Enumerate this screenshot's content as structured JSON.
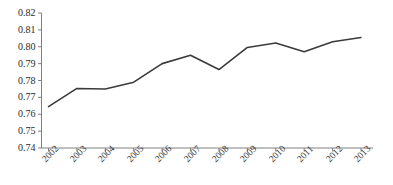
{
  "chart_data": {
    "type": "line",
    "title": "",
    "subtitle": "",
    "xlabel": "",
    "ylabel": "",
    "categories": [
      "2002",
      "2003",
      "2004",
      "2005",
      "2006",
      "2007",
      "2008",
      "2009",
      "2010",
      "2011",
      "2012",
      "2013"
    ],
    "values": [
      0.7645,
      0.7753,
      0.775,
      0.779,
      0.79,
      0.795,
      0.7865,
      0.7996,
      0.8022,
      0.797,
      0.803,
      0.8055
    ],
    "series": [
      {
        "name": "",
        "values": [
          0.7645,
          0.7753,
          0.775,
          0.779,
          0.79,
          0.795,
          0.7865,
          0.7996,
          0.8022,
          0.797,
          0.803,
          0.8055
        ]
      }
    ],
    "ylim": [
      0.74,
      0.82
    ],
    "yticks": [
      0.74,
      0.75,
      0.76,
      0.77,
      0.78,
      0.79,
      0.8,
      0.81,
      0.82
    ],
    "ytick_labels": [
      "0.74",
      "0.75",
      "0.76",
      "0.77",
      "0.78",
      "0.79",
      "0.80",
      "0.81",
      "0.82"
    ],
    "xtick_labels": [
      "2002",
      "2003",
      "2004",
      "2005",
      "2006",
      "2007",
      "2008",
      "2009",
      "2010",
      "2011",
      "2012",
      "2013"
    ],
    "grid": false,
    "legend": false,
    "legend_position": "none",
    "line_color": "#3b3b3b",
    "axis_color": "#808080",
    "background_color": "#ffffff",
    "marker": "none",
    "line_width": 1.6,
    "xtick_rotation": -45
  }
}
